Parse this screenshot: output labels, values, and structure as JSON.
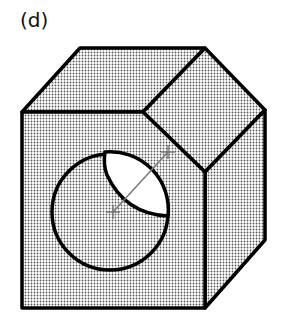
{
  "figure": {
    "label": "(d)",
    "colors": {
      "outline": "#000000",
      "shading": "#555555",
      "background": "#ffffff"
    }
  }
}
